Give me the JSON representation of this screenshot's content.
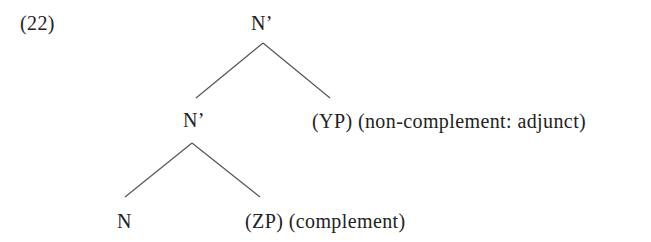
{
  "example_number": "(22)",
  "tree": {
    "root": {
      "label": "N’"
    },
    "intermediate": {
      "label": "N’"
    },
    "adjunct": {
      "label": "(YP) (non-complement: adjunct)"
    },
    "head": {
      "label": "N"
    },
    "complement": {
      "label": "(ZP) (complement)"
    }
  },
  "colors": {
    "text": "#222222",
    "lines": "#555555",
    "background": "#ffffff"
  }
}
